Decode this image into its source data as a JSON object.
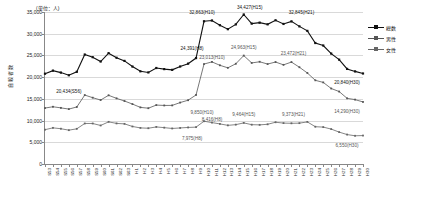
{
  "chart_data": {
    "type": "line",
    "title": "",
    "unit_note": "(単位：人)",
    "ylabel": "自殺者数",
    "xlabel": "",
    "ylim": [
      0,
      35000
    ],
    "ytick_values": [
      0,
      5000,
      10000,
      15000,
      20000,
      25000,
      30000,
      35000
    ],
    "ytick_labels": [
      "0",
      "5,000",
      "10,000",
      "15,000",
      "20,000",
      "25,000",
      "30,000",
      "35,000"
    ],
    "grid": true,
    "legend_position": "right",
    "categories": [
      "S53",
      "S54",
      "S55",
      "S56",
      "S57",
      "S58",
      "S59",
      "S60",
      "S61",
      "S62",
      "S63",
      "H1",
      "H2",
      "H3",
      "H4",
      "H5",
      "H6",
      "H7",
      "H8",
      "H9",
      "H10",
      "H11",
      "H12",
      "H13",
      "H14",
      "H15",
      "H16",
      "H17",
      "H18",
      "H19",
      "H20",
      "H21",
      "H22",
      "H23",
      "H24",
      "H25",
      "H26",
      "H27",
      "H28",
      "H29",
      "H30"
    ],
    "series": [
      {
        "name": "総数",
        "color": "#111111",
        "marker": "square",
        "values": [
          20788,
          21503,
          21048,
          20434,
          21228,
          25202,
          24596,
          23599,
          25524,
          24460,
          23742,
          22436,
          21346,
          21084,
          22104,
          21851,
          21679,
          22445,
          23104,
          24391,
          32863,
          33048,
          31957,
          31042,
          32143,
          34427,
          32325,
          32552,
          32155,
          33093,
          32249,
          32845,
          31690,
          30651,
          27858,
          27283,
          25427,
          24025,
          21897,
          21321,
          20840
        ]
      },
      {
        "name": "男性",
        "color": "#555555",
        "marker": "square",
        "values": [
          12884,
          13179,
          12925,
          12643,
          13129,
          15872,
          15268,
          14728,
          15818,
          15113,
          14501,
          13796,
          13038,
          12846,
          13569,
          13481,
          13495,
          14144,
          14688,
          15901,
          23013,
          23512,
          22727,
          22144,
          23080,
          24963,
          23272,
          23540,
          23012,
          23478,
          22831,
          23472,
          22283,
          20955,
          19273,
          18787,
          17386,
          16681,
          15121,
          14826,
          14290
        ]
      },
      {
        "name": "女性",
        "color": "#666666",
        "marker": "square",
        "values": [
          7904,
          8324,
          8123,
          7791,
          8099,
          9330,
          9328,
          8871,
          9706,
          9347,
          9241,
          8640,
          8308,
          8238,
          8535,
          8370,
          8184,
          8301,
          8416,
          8490,
          9850,
          9536,
          9230,
          8898,
          9063,
          9464,
          9053,
          9012,
          9143,
          9615,
          9418,
          9373,
          9407,
          9696,
          8585,
          8496,
          8041,
          7344,
          6776,
          6495,
          6550
        ]
      }
    ],
    "annotations": [
      {
        "text": "20,434(S56)",
        "category": "S56",
        "series": "総数"
      },
      {
        "text": "24,391(H8)",
        "category": "H9",
        "series": "総数"
      },
      {
        "text": "32,863(H10)",
        "category": "H10",
        "series": "総数"
      },
      {
        "text": "34,427(H15)",
        "category": "H15",
        "series": "総数"
      },
      {
        "text": "32,845(H21)",
        "category": "H21",
        "series": "総数"
      },
      {
        "text": "20,840(H30)",
        "category": "H30",
        "series": "総数"
      },
      {
        "text": "23,013(H10)",
        "category": "H10",
        "series": "男性"
      },
      {
        "text": "24,963(H15)",
        "category": "H15",
        "series": "男性"
      },
      {
        "text": "23,472(H21)",
        "category": "H21",
        "series": "男性"
      },
      {
        "text": "14,290(H30)",
        "category": "H30",
        "series": "男性"
      },
      {
        "text": "8,416(H8)",
        "category": "H9",
        "series": "女性"
      },
      {
        "text": "7,975(H8)",
        "category": "H8",
        "series": "女性"
      },
      {
        "text": "9,850(H10)",
        "category": "H10",
        "series": "女性"
      },
      {
        "text": "9,464(H15)",
        "category": "H15",
        "series": "女性"
      },
      {
        "text": "9,373(H21)",
        "category": "H21",
        "series": "女性"
      },
      {
        "text": "6,550(H30)",
        "category": "H30",
        "series": "女性"
      }
    ]
  },
  "legend": {
    "items": [
      {
        "label": "総数"
      },
      {
        "label": "男性"
      },
      {
        "label": "女性"
      }
    ]
  }
}
